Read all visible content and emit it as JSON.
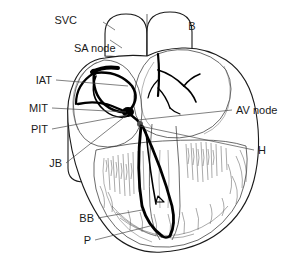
{
  "figure": {
    "background_color": "#ffffff",
    "line_color": "#1a1a1a",
    "conduction_color": "#000000",
    "leader_color": "#4a4a4a"
  },
  "labels": {
    "svc": "SVC",
    "b": "B",
    "sa_node": "SA node",
    "iat": "IAT",
    "mit": "MIT",
    "pit": "PIT",
    "jb": "JB",
    "bb": "BB",
    "p": "P",
    "av_node": "AV node",
    "h": "H"
  },
  "structures": {
    "sa_node_name": "sinoatrial-node",
    "av_node_name": "atrioventricular-node",
    "anterior_tract": "anterior-internodal-tract",
    "middle_tract": "middle-internodal-tract",
    "posterior_tract": "posterior-internodal-tract",
    "bundle_of_his": "bundle-of-his",
    "bundle_branches": "bundle-branches",
    "purkinje": "purkinje-fibers"
  }
}
